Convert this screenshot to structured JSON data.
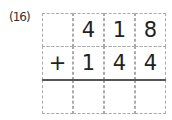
{
  "problem": {
    "number": "(16)",
    "rows": [
      [
        "",
        "4",
        "1",
        "8"
      ],
      [
        "+",
        "1",
        "4",
        "4"
      ],
      [
        "",
        "",
        "",
        ""
      ]
    ]
  }
}
